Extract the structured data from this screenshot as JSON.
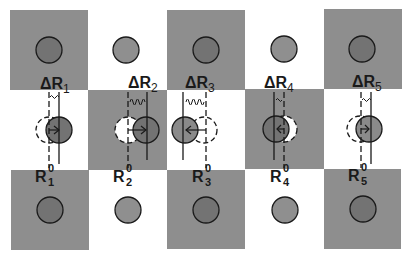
{
  "figure": {
    "colors": {
      "square_gray": "#8e8e8e",
      "background": "#ffffff",
      "atom_dark": "#737373",
      "atom_light": "#8f8f8f",
      "outline": "#1a1a1a",
      "vacancy_fill": "#ffffff"
    },
    "displacement_labels": [
      {
        "main": "ΔR",
        "sub": "1"
      },
      {
        "main": "ΔR",
        "sub": "2"
      },
      {
        "main": "ΔR",
        "sub": "3"
      },
      {
        "main": "ΔR",
        "sub": "4"
      },
      {
        "main": "ΔR",
        "sub": "5"
      }
    ],
    "reference_labels": [
      {
        "main": "R",
        "sup": "0",
        "sub": "1"
      },
      {
        "main": "R",
        "sup": "0",
        "sub": "2"
      },
      {
        "main": "R",
        "sup": "0",
        "sub": "3"
      },
      {
        "main": "R",
        "sup": "0",
        "sub": "4"
      },
      {
        "main": "R",
        "sup": "0",
        "sub": "5"
      }
    ],
    "displacement_directions": [
      "right",
      "right",
      "left",
      "left",
      "right"
    ]
  }
}
